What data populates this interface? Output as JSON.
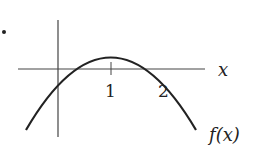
{
  "diagram": {
    "type": "function-graph",
    "bullet": "•",
    "axes": {
      "x_label": "x",
      "x_ticks": [
        {
          "value": 1,
          "label": "1"
        },
        {
          "value": 2,
          "label": "2"
        }
      ]
    },
    "curve": {
      "label": "f(x)",
      "roots": [
        0,
        2
      ],
      "vertex_x": 1,
      "shape": "concave-down parabola"
    },
    "colors": {
      "stroke": "#222222",
      "axis": "#444444",
      "background": "#ffffff"
    }
  }
}
